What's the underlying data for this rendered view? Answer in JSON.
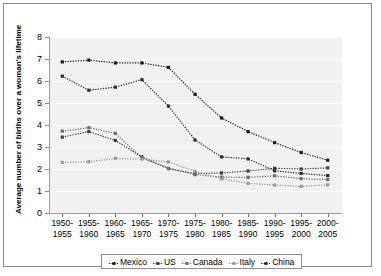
{
  "chart_data": {
    "type": "line",
    "title": "",
    "xlabel": "",
    "ylabel": "Average number of births over a woman's lifetime",
    "ylim": [
      0,
      8
    ],
    "yticks": [
      0,
      1,
      2,
      3,
      4,
      5,
      6,
      7,
      8
    ],
    "grid": true,
    "legend_position": "bottom",
    "categories": [
      "1950-\n1955",
      "1955-\n1960",
      "1960-\n1965",
      "1965-\n1970",
      "1970-\n1975",
      "1975-\n1980",
      "1980-\n1985",
      "1985-\n1990",
      "1990-\n1995",
      "1995-\n2000",
      "2000-\n2005"
    ],
    "series": [
      {
        "name": "Mexico",
        "color": "#1a1a1a",
        "values": [
          6.87,
          6.95,
          6.82,
          6.82,
          6.62,
          5.4,
          4.32,
          3.7,
          3.2,
          2.75,
          2.4
        ]
      },
      {
        "name": "US",
        "color": "#3d3d3d",
        "values": [
          3.45,
          3.7,
          3.3,
          2.55,
          2.02,
          1.79,
          1.82,
          1.91,
          2.03,
          2.0,
          2.05
        ]
      },
      {
        "name": "Canada",
        "color": "#6e6e6e",
        "values": [
          3.72,
          3.88,
          3.62,
          2.5,
          2.03,
          1.75,
          1.63,
          1.62,
          1.69,
          1.56,
          1.52
        ]
      },
      {
        "name": "Italy",
        "color": "#9a9a9a",
        "values": [
          2.3,
          2.33,
          2.48,
          2.45,
          2.32,
          1.9,
          1.55,
          1.35,
          1.27,
          1.21,
          1.28
        ]
      },
      {
        "name": "China",
        "color": "#2b2b2b",
        "values": [
          6.22,
          5.58,
          5.72,
          6.06,
          4.86,
          3.32,
          2.55,
          2.46,
          1.92,
          1.8,
          1.7
        ]
      }
    ]
  },
  "legend": {
    "items": [
      "Mexico",
      "US",
      "Canada",
      "Italy",
      "China"
    ]
  }
}
